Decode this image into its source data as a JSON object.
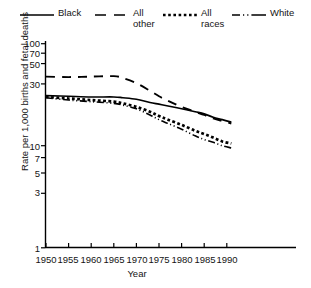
{
  "legend": {
    "items": [
      {
        "label": "Black",
        "style": "solid",
        "icon": "line-solid-icon"
      },
      {
        "label": "All\nother",
        "style": "dashed",
        "icon": "line-dashed-icon"
      },
      {
        "label": "All\nraces",
        "style": "dotted",
        "icon": "line-dotted-icon"
      },
      {
        "label": "White",
        "style": "dashdot",
        "icon": "line-dashdot-icon"
      }
    ]
  },
  "axes": {
    "ylabel": "Rate per 1,000 births and fetal deaths",
    "xlabel": "Year",
    "yticks": [
      "1",
      "3",
      "5",
      "7",
      "10",
      "30",
      "50",
      "70",
      "100"
    ],
    "xticks": [
      "1950",
      "1955",
      "1960",
      "1965",
      "1970",
      "1975",
      "1980",
      "1985",
      "1990"
    ]
  },
  "colors": {
    "line": "#000000",
    "axis": "#000000",
    "background": "#ffffff"
  },
  "chart_data": {
    "type": "line",
    "title": "",
    "xlabel": "Year",
    "ylabel": "Rate per 1,000 births and fetal deaths",
    "yscale": "log",
    "ylim": [
      1,
      100
    ],
    "xlim": [
      1950,
      1991
    ],
    "grid": false,
    "legend_position": "top",
    "yticks": [
      1,
      3,
      5,
      7,
      10,
      30,
      50,
      70,
      100
    ],
    "xticks": [
      1950,
      1955,
      1960,
      1965,
      1970,
      1975,
      1980,
      1985,
      1990
    ],
    "x": [
      1950,
      1955,
      1960,
      1965,
      1967,
      1970,
      1973,
      1975,
      1977,
      1980,
      1983,
      1985,
      1987,
      1989,
      1991
    ],
    "series": [
      {
        "name": "Black",
        "style": "solid",
        "values": [
          31.0,
          30.5,
          30.0,
          30.0,
          29.5,
          28.5,
          26.5,
          25.5,
          24.5,
          23.0,
          21.5,
          20.5,
          19.0,
          18.0,
          17.0
        ]
      },
      {
        "name": "All other",
        "style": "dashed",
        "values": [
          47.5,
          47.0,
          47.5,
          48.0,
          46.0,
          41.0,
          34.5,
          30.5,
          27.5,
          24.0,
          21.5,
          20.0,
          18.5,
          17.5,
          16.5
        ]
      },
      {
        "name": "All races",
        "style": "dotted",
        "values": [
          30.0,
          29.0,
          28.0,
          27.0,
          26.0,
          24.0,
          21.5,
          19.5,
          18.0,
          16.0,
          14.0,
          13.0,
          12.0,
          11.0,
          10.5
        ]
      },
      {
        "name": "White",
        "style": "dashdot",
        "values": [
          29.5,
          28.0,
          27.0,
          26.0,
          25.0,
          23.0,
          20.0,
          18.0,
          16.5,
          14.5,
          12.5,
          11.5,
          10.8,
          10.0,
          9.5
        ]
      }
    ]
  }
}
